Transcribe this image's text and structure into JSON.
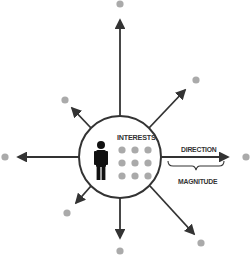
{
  "diagram": {
    "labels": {
      "interests": "INTERESTS",
      "direction": "DIRECTION",
      "magnitude": "MAGNITUDE"
    },
    "colors": {
      "line": "#333333",
      "dot": "#aaaaaa",
      "person": "#111111",
      "background": "#ffffff"
    },
    "center": {
      "x": 120,
      "y": 157,
      "r": 41
    },
    "vectors": [
      {
        "name": "up",
        "x1": 120,
        "y1": 116,
        "x2": 120,
        "y2": 20,
        "dot": [
          120,
          4
        ]
      },
      {
        "name": "up-right",
        "x1": 149,
        "y1": 128,
        "x2": 185,
        "y2": 90,
        "dot": [
          196,
          80
        ]
      },
      {
        "name": "right",
        "x1": 161,
        "y1": 157,
        "x2": 228,
        "y2": 157,
        "dot": [
          246,
          157
        ]
      },
      {
        "name": "down-right",
        "x1": 150,
        "y1": 186,
        "x2": 194,
        "y2": 234,
        "dot": [
          201,
          243
        ]
      },
      {
        "name": "down",
        "x1": 120,
        "y1": 198,
        "x2": 120,
        "y2": 238,
        "dot": [
          120,
          251
        ]
      },
      {
        "name": "down-left",
        "x1": 91,
        "y1": 186,
        "x2": 76,
        "y2": 203,
        "dot": [
          67,
          213
        ]
      },
      {
        "name": "left",
        "x1": 79,
        "y1": 157,
        "x2": 18,
        "y2": 157,
        "dot": [
          5,
          157
        ]
      },
      {
        "name": "up-left",
        "x1": 91,
        "y1": 128,
        "x2": 72,
        "y2": 108,
        "dot": [
          65,
          100
        ]
      }
    ],
    "interest_dots": {
      "rows": 3,
      "cols": 3,
      "start_x": 122,
      "start_y": 150,
      "gap": 13,
      "r": 3.6
    }
  }
}
